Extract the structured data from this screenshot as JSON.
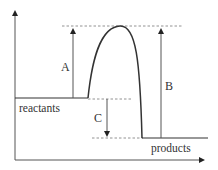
{
  "diagram": {
    "type": "energy-profile",
    "labels": {
      "reactants": "reactants",
      "products": "products",
      "arrow_a": "A",
      "arrow_b": "B",
      "arrow_c": "C"
    },
    "colors": {
      "line": "#333333",
      "dashed": "#777777",
      "background": "#ffffff"
    }
  }
}
